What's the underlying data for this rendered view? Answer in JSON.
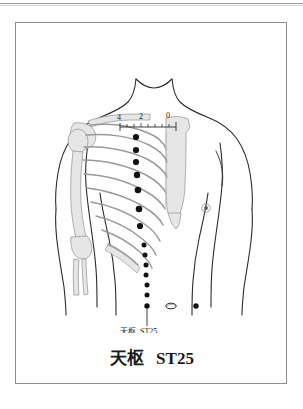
{
  "plate": {
    "title_cn": "天枢",
    "title_code": "ST25",
    "callout_cn": "天枢",
    "callout_code": "ST25"
  },
  "ruler": {
    "labels": [
      "4",
      "2",
      "0"
    ],
    "tick_count": 9,
    "unit_note": ""
  },
  "anatomy": {
    "body_fill": "#ffffff",
    "outline_color": "#2b2b2b",
    "bone_fill": "#e3e3e3",
    "bone_stroke": "#9a9a9a",
    "point_color": "#111111",
    "navel_label": "navel",
    "nipple_label": "nipple"
  },
  "points": {
    "major_dots_y": [
      114,
      127,
      139,
      152,
      167,
      186,
      203
    ],
    "minor_dots_y": [
      222,
      232,
      242,
      252,
      262,
      272,
      282
    ],
    "column_x": 120,
    "mirror_dot_x": 180,
    "navel_x": 152,
    "navel_y": 283
  },
  "colors": {
    "frame": "#8d8d8d",
    "rule": "#9a9a9a",
    "text": "#1a1a1a"
  }
}
